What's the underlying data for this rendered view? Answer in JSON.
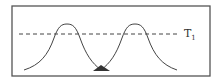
{
  "diagram": {
    "type": "two-gaussian-threshold",
    "threshold": {
      "label": "T",
      "subscript": "1"
    },
    "curves": [
      {
        "name": "left-peak"
      },
      {
        "name": "right-peak"
      }
    ],
    "marker": {
      "shape": "triangle",
      "position": "curve-intersection"
    },
    "colors": {
      "stroke": "#444444",
      "marker": "#333333",
      "frame": "#555555"
    }
  }
}
